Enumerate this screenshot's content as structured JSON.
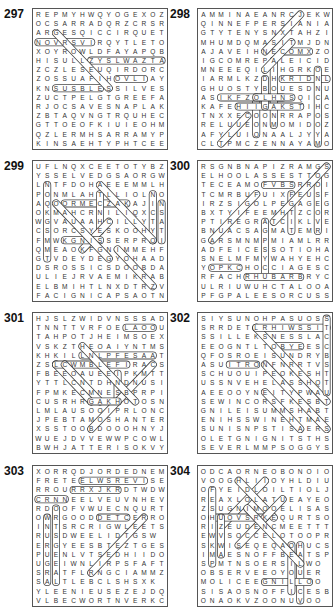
{
  "page": {
    "puzzles": [
      {
        "number": "297",
        "rows": [
          "REPMYHWQYOGEXOZ",
          "OCSARRADQRZCRSR",
          "ARGESQICCIRQUET",
          "NOVRSVIRQYTLETO",
          "XOYROWLDFAYAPQB",
          "HISULLZYSLWAZTA",
          "ZCZLESEUQIRDORC",
          "ZOSSUAFIHOVLIAY",
          "KNSUSBLESSILVES",
          "ZUCTPELGTGREEFA",
          "RJOCSAVESNAPLAK",
          "ZBTAQVNGTRQUHEC",
          "GTTOEOFKIUIEOHM",
          "QZLERMHSARRAMYP",
          "KINSAEHTYPHTCEE"
        ]
      },
      {
        "number": "298",
        "rows": [
          "AMMINAEANRCJEKW",
          "QINNEFPERSIANIA",
          "GTYTENYSNXTAHZI",
          "MHUMDQMASITMJDN",
          "AJAVEIHNECOMXZO",
          "IGCOMREPALEICID",
          "MNEEEQILIHGRKOE",
          "IARMLKZDHKRIDNL",
          "GHUOSTYBOUESDNU",
          "ASIKFZOLHNSQICA",
          "KAFEHIIGAKSTIHC",
          "TNXXECOONRRAPOS",
          "RELUUEONMOMIDOZ",
          "AFYLUIONAALJYYA",
          "CLTPMCZENNAYAMO"
        ]
      },
      {
        "number": "299",
        "rows": [
          "UFLNQXCEETOTYBZ",
          "YSSELVEDGSAORGW",
          "LNTFDOHAEEEMMLH",
          "PONMLAHTLLIOLNO",
          "AQOORMECZAKAJIN",
          "OKMAHCRNILIQXCS",
          "WGVAUAAHCILLYTA",
          "CSORCSYESKOOHYT",
          "FMWKGNISSERPROI",
          "QMEAOKFGNIMMEHF",
          "GTVDEYDEGYOHAAD",
          "DSROSSICSDOOBDA",
          "ULIEJRVAEMIKRAB",
          "ELBMIHTLNXDTRZV",
          "FACIGNICAPSAOTN"
        ]
      },
      {
        "number": "300",
        "rows": [
          "RSGNBNAPIZRAMGS",
          "ELHOOLASSESTTOG",
          "TECEAMOFVBSRROI",
          "TCMRBUFUIXFEUSF",
          "IRZSIGOLPEGAGEG",
          "BXTYIFEEMHTZCORL",
          "PTIREGRATCIKLVEN",
          "BNUACSAGMATEMRI",
          "GARSMNMPMIAMLRR",
          "ADFEICESSOTIOHA",
          "SNELMFMYWAHYEHC",
          "YOPKCHOCCIAGESC",
          "RFACHRHUBARBRYC",
          "ULRIUWUHCTALOOA",
          "PFGPALEESORCUSS"
        ]
      },
      {
        "number": "301",
        "rows": [
          "HJSLZWIDVNSSSAD",
          "TNNTTVRFOELAOOU",
          "TAHPOTJHEIMSOEX",
          "VSKZTHEOAIYNTMS",
          "KHKILLNLPFESAAT",
          "ZSLCWMBLEFIRACS",
          "FBEEOAUEEIPKMTT",
          "YTTLCNTDHNDNUSIS",
          "FPMKECMNESBPRPIO",
          "CUSRHRGAKHOTOSN",
          "LMLAUSOOIPRLONC",
          "JPEBTAMOSHANTER",
          "XSSTOOBDOOOHNYJS",
          "WUEJDVVEWWPCOWL",
          "BWHJATTERISOKVY"
        ]
      },
      {
        "number": "302",
        "rows": [
          "SIYSUNOHPASUOSS",
          "SRRDETLRHIWSSIT",
          "SSILLEKSNESSLAC",
          "EEOGNTLTOBYEESC",
          "QFOSROEISUNDRYB",
          "ASUITRONFNRRTVS",
          "SCHUOUIPEOKESHT",
          "USSNVEHELASSHQTR",
          "AEEOOYNEITYPWAU",
          "SEWINCORSFKESBT",
          "GNILEISUMMSHABT",
          "ENIHSSWINEHTMAE",
          "SUNISNPSTISAERSO",
          "OLETGNIGNITSTHS",
          "SEVERLMMPSOGGYS"
        ]
      },
      {
        "number": "303",
        "rows": [
          "XORRQDJORDEDNEM",
          "FRETEELWSREVISED",
          "RROURRXJKRDTWDW",
          "CRNNEELVEUVNHEV",
          "RDOOFVWUECNQURT",
          "OWRGOODDETCERROC",
          "INTSRCRIGWLEETS",
          "RUSDWEELIDTGSW",
          "ERGYEESBTEZTGES",
          "PUENLVTSEDHIIDO",
          "UGEIWNLIRPSFAFT",
          "SRATFLRNGCIAMMZ",
          "SALTLEBCLSHSXK",
          "YLEENIEUSEZEJDQ",
          "VLBECWORTNVERKC"
        ]
      },
      {
        "number": "304",
        "rows": [
          "ODCAORNEOBONOIO",
          "VOOGHLIIOYHLDIUA",
          "OFYEIDLOILTIOLJ",
          "REAXLOLATUEAYEO",
          "ZSUGNIMOOELISAS",
          "OHUOVSRKEQURTSO",
          "RIZEUDENCMEETTT",
          "EWVSOCCELOTOOPR",
          "SKWISEQEQAOHUCS",
          "IMAESNOFFBEATSP",
          "SPMTNSOERSILWO",
          "OBSERVEEOYOUER",
          "MOLICEEGNILLOO",
          "SISAOSNOFFICESB",
          "ONAOKVZOONUVOO"
        ]
      }
    ]
  }
}
